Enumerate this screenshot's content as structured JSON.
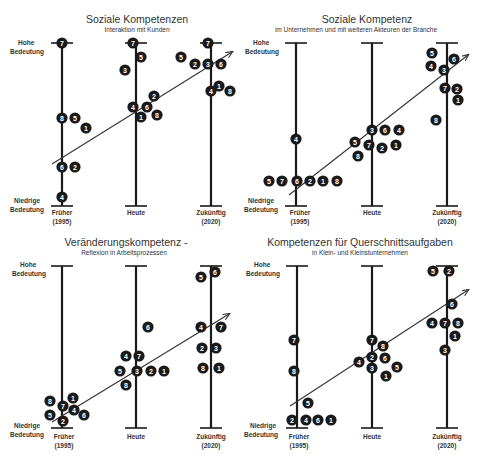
{
  "chart_data": [
    {
      "type": "scatter",
      "title": "Soziale Kompetenzen",
      "subtitle": "Interaktion mit Kunden",
      "ylabel_top": "Hohe Bedeutung",
      "ylabel_bottom": "Niedrige Bedeutung",
      "categories": [
        "Früher (1995)",
        "Heute",
        "Zukünftig (2020)"
      ],
      "axes_x": [
        62,
        136,
        211
      ],
      "top_y": 43,
      "bottom_y": 206,
      "trend": [
        52,
        164,
        232,
        52
      ],
      "points": [
        {
          "cat": 0,
          "label": "7",
          "x": 62,
          "y": 43
        },
        {
          "cat": 0,
          "label": "8",
          "x": 62,
          "y": 118
        },
        {
          "cat": 0,
          "label": "5",
          "x": 75,
          "y": 118
        },
        {
          "cat": 0,
          "label": "1",
          "x": 86,
          "y": 128
        },
        {
          "cat": 0,
          "label": "6",
          "x": 62,
          "y": 167
        },
        {
          "cat": 0,
          "label": "2",
          "x": 75,
          "y": 167
        },
        {
          "cat": 0,
          "label": "4",
          "x": 62,
          "y": 197
        },
        {
          "cat": 1,
          "label": "7",
          "x": 133,
          "y": 43
        },
        {
          "cat": 1,
          "label": "5",
          "x": 141,
          "y": 57
        },
        {
          "cat": 1,
          "label": "3",
          "x": 125,
          "y": 70
        },
        {
          "cat": 1,
          "label": "2",
          "x": 154,
          "y": 96
        },
        {
          "cat": 1,
          "label": "4",
          "x": 133,
          "y": 107
        },
        {
          "cat": 1,
          "label": "6",
          "x": 147,
          "y": 107
        },
        {
          "cat": 1,
          "label": "1",
          "x": 141,
          "y": 117
        },
        {
          "cat": 1,
          "label": "8",
          "x": 157,
          "y": 115
        },
        {
          "cat": 2,
          "label": "7",
          "x": 208,
          "y": 43
        },
        {
          "cat": 2,
          "label": "5",
          "x": 181,
          "y": 57
        },
        {
          "cat": 2,
          "label": "2",
          "x": 195,
          "y": 64
        },
        {
          "cat": 2,
          "label": "3",
          "x": 208,
          "y": 64
        },
        {
          "cat": 2,
          "label": "6",
          "x": 221,
          "y": 64
        },
        {
          "cat": 2,
          "label": "4",
          "x": 211,
          "y": 91
        },
        {
          "cat": 2,
          "label": "1",
          "x": 219,
          "y": 86
        },
        {
          "cat": 2,
          "label": "8",
          "x": 230,
          "y": 91
        }
      ]
    },
    {
      "type": "scatter",
      "title": "Soziale Kompetenz",
      "subtitle": "im Unternehmen und mit weiteren Akteuren der Branche",
      "ylabel_top": "Hohe Bedeutung",
      "ylabel_bottom": "Niedrige Bedeutung",
      "categories": [
        "Früher (1995)",
        "Heute",
        "Zukünftig (2020)"
      ],
      "axes_x": [
        296,
        372,
        447
      ],
      "top_y": 43,
      "bottom_y": 206,
      "trend": [
        289,
        195,
        468,
        55
      ],
      "points": [
        {
          "cat": 0,
          "label": "4",
          "x": 296,
          "y": 139
        },
        {
          "cat": 0,
          "label": "5",
          "x": 269,
          "y": 181
        },
        {
          "cat": 0,
          "label": "7",
          "x": 282,
          "y": 181
        },
        {
          "cat": 0,
          "label": "6",
          "x": 297,
          "y": 181
        },
        {
          "cat": 0,
          "label": "2",
          "x": 310,
          "y": 181
        },
        {
          "cat": 0,
          "label": "1",
          "x": 323,
          "y": 181
        },
        {
          "cat": 0,
          "label": "8",
          "x": 337,
          "y": 181
        },
        {
          "cat": 1,
          "label": "3",
          "x": 372,
          "y": 130
        },
        {
          "cat": 1,
          "label": "6",
          "x": 385,
          "y": 130
        },
        {
          "cat": 1,
          "label": "4",
          "x": 399,
          "y": 130
        },
        {
          "cat": 1,
          "label": "5",
          "x": 355,
          "y": 142
        },
        {
          "cat": 1,
          "label": "7",
          "x": 369,
          "y": 145
        },
        {
          "cat": 1,
          "label": "2",
          "x": 382,
          "y": 148
        },
        {
          "cat": 1,
          "label": "1",
          "x": 396,
          "y": 145
        },
        {
          "cat": 1,
          "label": "8",
          "x": 358,
          "y": 156
        },
        {
          "cat": 2,
          "label": "5",
          "x": 432,
          "y": 53
        },
        {
          "cat": 2,
          "label": "4",
          "x": 431,
          "y": 66
        },
        {
          "cat": 2,
          "label": "3",
          "x": 444,
          "y": 70
        },
        {
          "cat": 2,
          "label": "6",
          "x": 454,
          "y": 59
        },
        {
          "cat": 2,
          "label": "7",
          "x": 445,
          "y": 88
        },
        {
          "cat": 2,
          "label": "2",
          "x": 457,
          "y": 89
        },
        {
          "cat": 2,
          "label": "1",
          "x": 458,
          "y": 100
        },
        {
          "cat": 2,
          "label": "8",
          "x": 436,
          "y": 120
        }
      ]
    },
    {
      "type": "scatter",
      "title": "Veränderungskompetenz -",
      "subtitle": "Reflexion in Arbeitsprozessen",
      "ylabel_top": "Hohe Bedeutung",
      "ylabel_bottom": "Niedrige Bedeutung",
      "categories": [
        "Früher (1995)",
        "Heute",
        "Zukünftig (2020)"
      ],
      "axes_x": [
        62,
        136,
        211
      ],
      "top_y": 266,
      "bottom_y": 428,
      "trend": [
        52,
        422,
        229,
        314
      ],
      "points": [
        {
          "cat": 0,
          "label": "8",
          "x": 50,
          "y": 401
        },
        {
          "cat": 0,
          "label": "1",
          "x": 73,
          "y": 398
        },
        {
          "cat": 0,
          "label": "7",
          "x": 63,
          "y": 406
        },
        {
          "cat": 0,
          "label": "4",
          "x": 74,
          "y": 410
        },
        {
          "cat": 0,
          "label": "5",
          "x": 50,
          "y": 415
        },
        {
          "cat": 0,
          "label": "6",
          "x": 84,
          "y": 415
        },
        {
          "cat": 0,
          "label": "2",
          "x": 63,
          "y": 421
        },
        {
          "cat": 1,
          "label": "6",
          "x": 148,
          "y": 327
        },
        {
          "cat": 1,
          "label": "4",
          "x": 126,
          "y": 356
        },
        {
          "cat": 1,
          "label": "7",
          "x": 139,
          "y": 356
        },
        {
          "cat": 1,
          "label": "5",
          "x": 120,
          "y": 371
        },
        {
          "cat": 1,
          "label": "3",
          "x": 137,
          "y": 371
        },
        {
          "cat": 1,
          "label": "2",
          "x": 151,
          "y": 371
        },
        {
          "cat": 1,
          "label": "1",
          "x": 164,
          "y": 371
        },
        {
          "cat": 1,
          "label": "8",
          "x": 126,
          "y": 385
        },
        {
          "cat": 2,
          "label": "5",
          "x": 201,
          "y": 277
        },
        {
          "cat": 2,
          "label": "6",
          "x": 215,
          "y": 272
        },
        {
          "cat": 2,
          "label": "4",
          "x": 201,
          "y": 327
        },
        {
          "cat": 2,
          "label": "7",
          "x": 221,
          "y": 327
        },
        {
          "cat": 2,
          "label": "2",
          "x": 202,
          "y": 348
        },
        {
          "cat": 2,
          "label": "3",
          "x": 216,
          "y": 348
        },
        {
          "cat": 2,
          "label": "8",
          "x": 203,
          "y": 368
        },
        {
          "cat": 2,
          "label": "1",
          "x": 219,
          "y": 368
        }
      ]
    },
    {
      "type": "scatter",
      "title": "Kompetenzen für Querschnittsaufgaben",
      "subtitle": "in Klein- und Kleinstunternehmen",
      "ylabel_top": "Hohe Bedeutung",
      "ylabel_bottom": "Niedrige Bedeutung",
      "categories": [
        "Früher (1995)",
        "Heute",
        "Zukünftig (2020)"
      ],
      "axes_x": [
        297,
        372,
        447
      ],
      "top_y": 266,
      "bottom_y": 428,
      "trend": [
        290,
        406,
        468,
        290
      ],
      "points": [
        {
          "cat": 0,
          "label": "7",
          "x": 294,
          "y": 340
        },
        {
          "cat": 0,
          "label": "8",
          "x": 294,
          "y": 371
        },
        {
          "cat": 0,
          "label": "5",
          "x": 308,
          "y": 403
        },
        {
          "cat": 0,
          "label": "2",
          "x": 292,
          "y": 420
        },
        {
          "cat": 0,
          "label": "4",
          "x": 306,
          "y": 420
        },
        {
          "cat": 0,
          "label": "6",
          "x": 318,
          "y": 420
        },
        {
          "cat": 0,
          "label": "1",
          "x": 331,
          "y": 420
        },
        {
          "cat": 1,
          "label": "7",
          "x": 372,
          "y": 340
        },
        {
          "cat": 1,
          "label": "8",
          "x": 383,
          "y": 346
        },
        {
          "cat": 1,
          "label": "4",
          "x": 359,
          "y": 362
        },
        {
          "cat": 1,
          "label": "2",
          "x": 372,
          "y": 357
        },
        {
          "cat": 1,
          "label": "6",
          "x": 385,
          "y": 358
        },
        {
          "cat": 1,
          "label": "3",
          "x": 372,
          "y": 368
        },
        {
          "cat": 1,
          "label": "5",
          "x": 397,
          "y": 367
        },
        {
          "cat": 1,
          "label": "1",
          "x": 386,
          "y": 376
        },
        {
          "cat": 2,
          "label": "5",
          "x": 433,
          "y": 271
        },
        {
          "cat": 2,
          "label": "2",
          "x": 449,
          "y": 271
        },
        {
          "cat": 2,
          "label": "6",
          "x": 452,
          "y": 304
        },
        {
          "cat": 2,
          "label": "4",
          "x": 432,
          "y": 323
        },
        {
          "cat": 2,
          "label": "7",
          "x": 445,
          "y": 323
        },
        {
          "cat": 2,
          "label": "8",
          "x": 458,
          "y": 323
        },
        {
          "cat": 2,
          "label": "1",
          "x": 455,
          "y": 336
        },
        {
          "cat": 2,
          "label": "3",
          "x": 445,
          "y": 350
        }
      ]
    }
  ],
  "panels": [
    {
      "title": "Soziale Kompetenzen",
      "subtitle": "Interaktion mit Kunden",
      "hohe1": "Hohe",
      "hohe2": "Bedeutung",
      "nied1": "Niedrige",
      "nied2": "Bedeutung",
      "ax0a": "Früher",
      "ax0b": "(1995)",
      "ax1": "Heute",
      "ax2a": "Zukünftig",
      "ax2b": "(2020)"
    },
    {
      "title": "Soziale Kompetenz",
      "subtitle": "im Unternehmen und mit weiteren Akteuren der Branche",
      "hohe1": "Hohe",
      "hohe2": "Bedeutung",
      "nied1": "Niedrige",
      "nied2": "Bedeutung",
      "ax0a": "Früher",
      "ax0b": "(1995)",
      "ax1": "Heute",
      "ax2a": "Zukünftig",
      "ax2b": "(2020)"
    },
    {
      "title": "Veränderungskompetenz -",
      "subtitle": "Reflexion in Arbeitsprozessen",
      "hohe1": "Hohe",
      "hohe2": "Bedeutung",
      "nied1": "Niedrige",
      "nied2": "Bedeutung",
      "ax0a": "Früher",
      "ax0b": "(1995)",
      "ax1": "Heute",
      "ax2a": "Zukünftig",
      "ax2b": "(2020)"
    },
    {
      "title": "Kompetenzen für Querschnittsaufgaben",
      "subtitle": "in Klein- und Kleinstunternehmen",
      "hohe1": "Hohe",
      "hohe2": "Bedeutung",
      "nied1": "Niedrige",
      "nied2": "Bedeutung",
      "ax0a": "Früher",
      "ax0b": "(1995)",
      "ax1": "Heute",
      "ax2a": "Zukünftig",
      "ax2b": "(2020)"
    }
  ],
  "colors": {
    "marker": "#1a1a1a",
    "axis": "#1a1a1a",
    "trend": "#333333",
    "text": "#333333"
  }
}
